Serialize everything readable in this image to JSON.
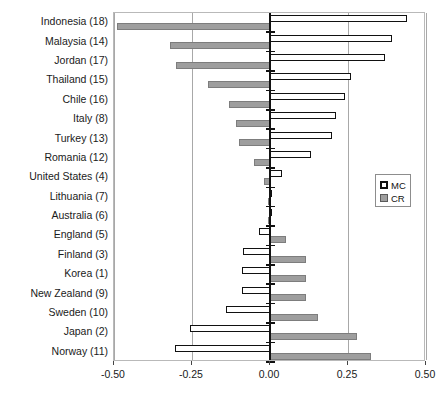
{
  "chart_data": {
    "type": "bar",
    "orientation": "horizontal",
    "title": "",
    "xlabel": "",
    "ylabel": "",
    "xlim": [
      -0.5,
      0.5
    ],
    "xticks": [
      "-0.50",
      "-0.25",
      "0.00",
      "0.25",
      "0.50"
    ],
    "xtick_values": [
      -0.5,
      -0.25,
      0,
      0.25,
      0.5
    ],
    "grid": true,
    "legend_position": "right-middle",
    "categories": [
      "Indonesia (18)",
      "Malaysia (14)",
      "Jordan (17)",
      "Thailand (15)",
      "Chile (16)",
      "Italy (8)",
      "Turkey (13)",
      "Romania (12)",
      "United States (4)",
      "Lithuania (7)",
      "Australia (6)",
      "England (5)",
      "Finland (3)",
      "Korea (1)",
      "New Zealand (9)",
      "Sweden (10)",
      "Japan (2)",
      "Norway (11)"
    ],
    "series": [
      {
        "name": "MC",
        "color": "#ffffff",
        "values": [
          0.44,
          0.39,
          0.37,
          0.26,
          0.24,
          0.21,
          0.2,
          0.13,
          0.04,
          0.005,
          0.005,
          -0.035,
          -0.085,
          -0.09,
          -0.09,
          -0.14,
          -0.255,
          -0.305
        ]
      },
      {
        "name": "CR",
        "color": "#9e9e9e",
        "values": [
          -0.49,
          -0.32,
          -0.3,
          -0.2,
          -0.13,
          -0.11,
          -0.1,
          -0.05,
          -0.02,
          -0.005,
          -0.005,
          0.05,
          0.115,
          0.115,
          0.115,
          0.155,
          0.28,
          0.325
        ]
      }
    ]
  },
  "legend": {
    "items": [
      {
        "label": "MC",
        "swatch": "hollow-white-square"
      },
      {
        "label": "CR",
        "swatch": "gray-filled-square"
      }
    ]
  }
}
